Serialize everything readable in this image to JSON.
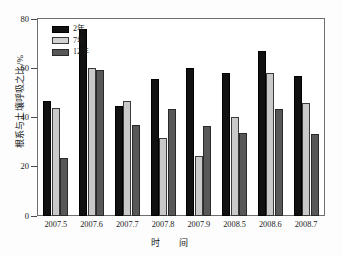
{
  "chart_data": {
    "type": "bar",
    "title": "",
    "xlabel": "时　间",
    "ylabel": "根系与土壤呼吸之比/%",
    "ylim": [
      0,
      80
    ],
    "yticks": [
      0,
      20,
      40,
      60,
      80
    ],
    "grid": false,
    "legend_position": "top-left",
    "categories": [
      "2007.5",
      "2007.6",
      "2007.7",
      "2007.8",
      "2007.9",
      "2008.5",
      "2008.6",
      "2008.7"
    ],
    "series": [
      {
        "name": "2年",
        "color": "#111111",
        "values": [
          46.8,
          76.0,
          44.8,
          55.5,
          60.0,
          58.0,
          67.2,
          57.0
        ]
      },
      {
        "name": "7年",
        "color": "#c9c9c9",
        "values": [
          43.8,
          60.2,
          46.8,
          31.8,
          24.3,
          40.2,
          58.2,
          46.0
        ]
      },
      {
        "name": "12年",
        "color": "#585858",
        "values": [
          23.6,
          59.4,
          37.0,
          43.5,
          36.4,
          33.6,
          43.6,
          33.5
        ]
      }
    ]
  },
  "axis": {
    "y_tick_labels": [
      "0",
      "20",
      "40",
      "60",
      "80"
    ],
    "y_axis_title": "根系与土壤呼吸之比/%",
    "x_axis_title": "时　间"
  }
}
